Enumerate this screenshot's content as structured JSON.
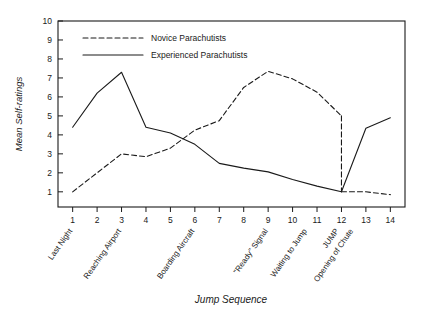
{
  "chart_data": {
    "type": "line",
    "title": "",
    "xlabel": "Jump Sequence",
    "ylabel": "Mean Self-ratings",
    "xlim": [
      0.4,
      14.6
    ],
    "ylim": [
      0.2,
      10
    ],
    "grid": false,
    "legend_position": "top-left-inside",
    "x": [
      1,
      2,
      3,
      4,
      5,
      6,
      7,
      8,
      9,
      10,
      11,
      12,
      13,
      14
    ],
    "xticklabels": [
      "1",
      "2",
      "3",
      "4",
      "5",
      "6",
      "7",
      "8",
      "9",
      "10",
      "11",
      "12",
      "13",
      "14"
    ],
    "yticks": [
      1,
      2,
      3,
      4,
      5,
      6,
      7,
      8,
      9,
      10
    ],
    "yticklabels": [
      "1",
      "2",
      "3",
      "4",
      "5",
      "6",
      "7",
      "8",
      "9",
      "10"
    ],
    "category_labels": [
      {
        "text": "Last Night",
        "x": 1
      },
      {
        "text": "Reaching Airport",
        "x": 3
      },
      {
        "text": "Boarding Aircraft",
        "x": 6
      },
      {
        "text": "\"Ready\" Signal",
        "x": 9
      },
      {
        "text": "Waiting to Jump",
        "x": 10.6
      },
      {
        "text": "JUMP",
        "x": 11.9
      },
      {
        "text": "Opening of Chute",
        "x": 12.5
      }
    ],
    "series": [
      {
        "name": "Novice Parachutists",
        "style": "dashed",
        "color": "#1a1a1a",
        "values": [
          1.0,
          2.0,
          3.0,
          2.85,
          3.3,
          4.25,
          4.75,
          6.5,
          7.35,
          6.95,
          6.25,
          5.0,
          1.0,
          0.85
        ],
        "jump_drop": {
          "x": 12,
          "from": 5.0,
          "to": 1.0
        }
      },
      {
        "name": "Experienced Parachutists",
        "style": "solid",
        "color": "#1a1a1a",
        "values": [
          4.4,
          6.2,
          7.3,
          4.4,
          4.1,
          3.5,
          2.5,
          2.25,
          2.05,
          1.65,
          1.3,
          1.0,
          4.35,
          4.9
        ]
      }
    ]
  },
  "legend": {
    "entries": [
      {
        "label": "Novice Parachutists",
        "style": "dashed"
      },
      {
        "label": "Experienced Parachutists",
        "style": "solid"
      }
    ]
  }
}
